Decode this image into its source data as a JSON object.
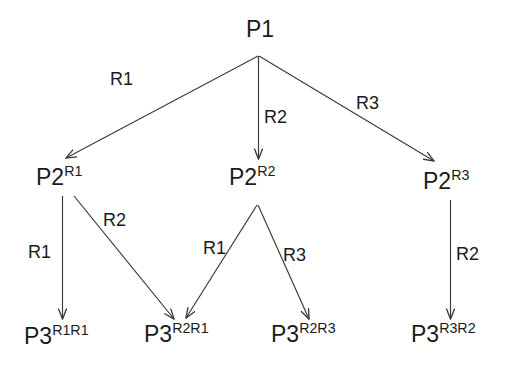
{
  "diagram": {
    "stroke_color": "#3a3a3a",
    "text_color": "#1a1a1a",
    "background_color": "#ffffff",
    "nodes": [
      {
        "id": "p1",
        "base": "P1",
        "sup": "",
        "x": 246,
        "y": 18
      },
      {
        "id": "p2r1",
        "base": "P2",
        "sup": "R1",
        "x": 36,
        "y": 166
      },
      {
        "id": "p2r2",
        "base": "P2",
        "sup": "R2",
        "x": 229,
        "y": 166
      },
      {
        "id": "p2r3",
        "base": "P2",
        "sup": "R3",
        "x": 423,
        "y": 170
      },
      {
        "id": "p3r1r1",
        "base": "P3",
        "sup": "R1R1",
        "x": 24,
        "y": 325
      },
      {
        "id": "p3r2r1",
        "base": "P3",
        "sup": "R2R1",
        "x": 144,
        "y": 323
      },
      {
        "id": "p3r2r3",
        "base": "P3",
        "sup": "R2R3",
        "x": 271,
        "y": 323
      },
      {
        "id": "p3r3r2",
        "base": "P3",
        "sup": "R3R2",
        "x": 411,
        "y": 323
      }
    ],
    "edges": [
      {
        "id": "e1",
        "from": "p1",
        "to": "p2r1",
        "label": "R1",
        "lx": 110,
        "ly": 70
      },
      {
        "id": "e2",
        "from": "p1",
        "to": "p2r2",
        "label": "R2",
        "lx": 264,
        "ly": 108
      },
      {
        "id": "e3",
        "from": "p1",
        "to": "p2r3",
        "label": "R3",
        "lx": 356,
        "ly": 94
      },
      {
        "id": "e4",
        "from": "p2r1",
        "to": "p3r1r1",
        "label": "R1",
        "lx": 28,
        "ly": 243
      },
      {
        "id": "e5",
        "from": "p2r1",
        "to": "p3r2r1",
        "label": "R2",
        "lx": 103,
        "ly": 211
      },
      {
        "id": "e6",
        "from": "p2r2",
        "to": "p3r2r1",
        "label": "R1",
        "lx": 203,
        "ly": 239
      },
      {
        "id": "e7",
        "from": "p2r2",
        "to": "p3r2r3",
        "label": "R3",
        "lx": 283,
        "ly": 246
      },
      {
        "id": "e8",
        "from": "p2r3",
        "to": "p3r3r2",
        "label": "R2",
        "lx": 456,
        "ly": 245
      }
    ]
  }
}
